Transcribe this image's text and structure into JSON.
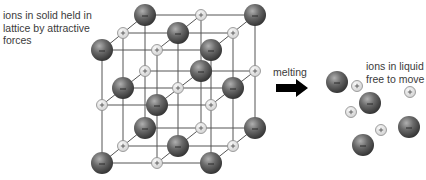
{
  "labels": {
    "solid": [
      "ions in solid held in",
      "lattice by attractive",
      "forces"
    ],
    "process": "melting",
    "liquid": [
      "ions in liquid",
      "free to move"
    ]
  },
  "ion_signs": {
    "anion": "−",
    "cation": "+"
  },
  "colors": {
    "lattice_line": "#555555",
    "anion_dark": "#3e3e3e",
    "anion_light": "#a8a8a8",
    "cation_fill": "#e4e4e4",
    "cation_stroke": "#8a8a8a",
    "arrow": "#000000",
    "text": "#3a3a3a"
  },
  "lattice": {
    "size": "3x3x3",
    "layers": [
      {
        "depth": "back",
        "xs": [
          145,
          201,
          255
        ],
        "ys": [
          15,
          71,
          128
        ],
        "start": "anion"
      },
      {
        "depth": "middle",
        "xs": [
          123,
          178,
          233
        ],
        "ys": [
          33,
          88,
          146
        ],
        "start": "cation"
      },
      {
        "depth": "front",
        "xs": [
          102,
          157,
          211
        ],
        "ys": [
          50,
          105,
          163
        ],
        "start": "anion"
      }
    ]
  },
  "liquid_ions": [
    {
      "type": "anion",
      "x": 337,
      "y": 82
    },
    {
      "type": "cation",
      "x": 357,
      "y": 86
    },
    {
      "type": "anion",
      "x": 370,
      "y": 103
    },
    {
      "type": "cation",
      "x": 410,
      "y": 92
    },
    {
      "type": "cation",
      "x": 351,
      "y": 112
    },
    {
      "type": "cation",
      "x": 381,
      "y": 130
    },
    {
      "type": "anion",
      "x": 409,
      "y": 127
    },
    {
      "type": "anion",
      "x": 363,
      "y": 145
    }
  ]
}
